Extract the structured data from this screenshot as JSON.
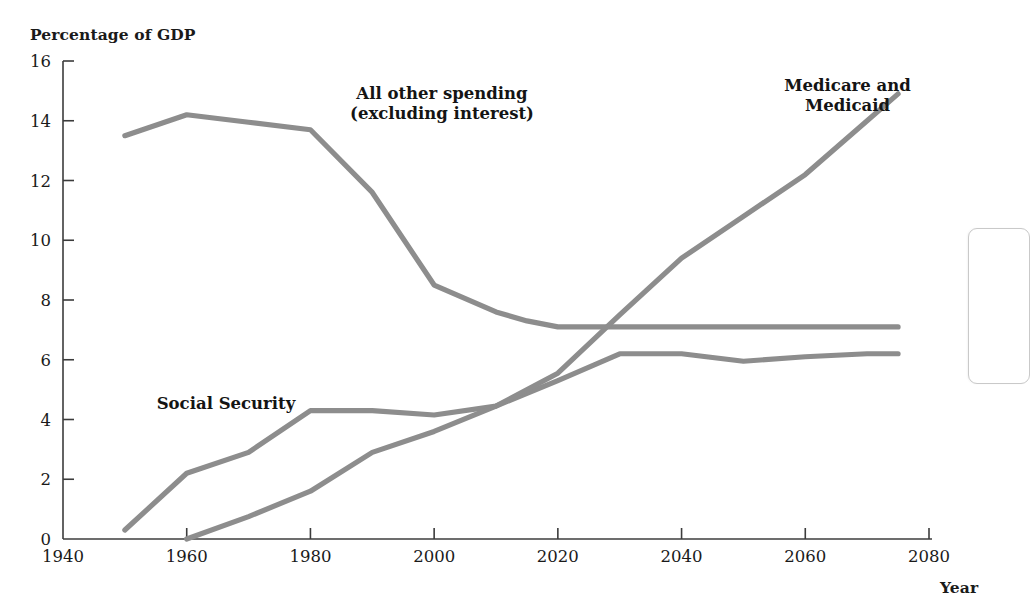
{
  "figure": {
    "y_axis_title": "Percentage of GDP",
    "x_axis_title": "Year",
    "line_color": "#8d8d8d",
    "axis_color": "#3c3c3c",
    "background": "#ffffff"
  },
  "labels": {
    "all_other": "All other spending\n(excluding interest)",
    "medicare": "Medicare and\nMedicaid",
    "social_security": "Social Security"
  },
  "chart_data": {
    "type": "line",
    "title": "",
    "subtitle": "",
    "xlabel": "Year",
    "ylabel": "Percentage of GDP",
    "xlim": [
      1940,
      2080
    ],
    "ylim": [
      0,
      16
    ],
    "xticks": [
      1940,
      1960,
      1980,
      2000,
      2020,
      2040,
      2060,
      2080
    ],
    "yticks": [
      0,
      2,
      4,
      6,
      8,
      10,
      12,
      14,
      16
    ],
    "grid": false,
    "legend": "inline-annotations",
    "series": [
      {
        "name": "All other spending (excluding interest)",
        "color": "#8d8d8d",
        "x": [
          1950,
          1960,
          1970,
          1980,
          1990,
          2000,
          2010,
          2015,
          2020,
          2030,
          2040,
          2050,
          2060,
          2070,
          2075
        ],
        "values": [
          13.5,
          14.2,
          13.95,
          13.7,
          11.6,
          8.5,
          7.6,
          7.3,
          7.1,
          7.1,
          7.1,
          7.1,
          7.1,
          7.1,
          7.1
        ]
      },
      {
        "name": "Social Security",
        "color": "#8d8d8d",
        "x": [
          1950,
          1960,
          1970,
          1980,
          1990,
          2000,
          2010,
          2020,
          2030,
          2040,
          2050,
          2060,
          2070,
          2075
        ],
        "values": [
          0.3,
          2.2,
          2.9,
          4.3,
          4.3,
          4.15,
          4.45,
          5.3,
          6.2,
          6.2,
          5.95,
          6.1,
          6.2,
          6.2
        ]
      },
      {
        "name": "Medicare and Medicaid",
        "color": "#8d8d8d",
        "x": [
          1960,
          1970,
          1980,
          1990,
          2000,
          2010,
          2020,
          2030,
          2040,
          2050,
          2060,
          2070,
          2075
        ],
        "values": [
          0.0,
          0.75,
          1.6,
          2.9,
          3.6,
          4.45,
          5.55,
          7.5,
          9.4,
          10.8,
          12.2,
          14.0,
          14.9
        ]
      }
    ],
    "annotations": [
      {
        "text": "All other spending (excluding interest)",
        "x": 1998,
        "y": 14.6
      },
      {
        "text": "Medicare and Medicaid",
        "x": 2070,
        "y": 15.0
      },
      {
        "text": "Social Security",
        "x": 1975,
        "y": 4.9
      }
    ]
  }
}
